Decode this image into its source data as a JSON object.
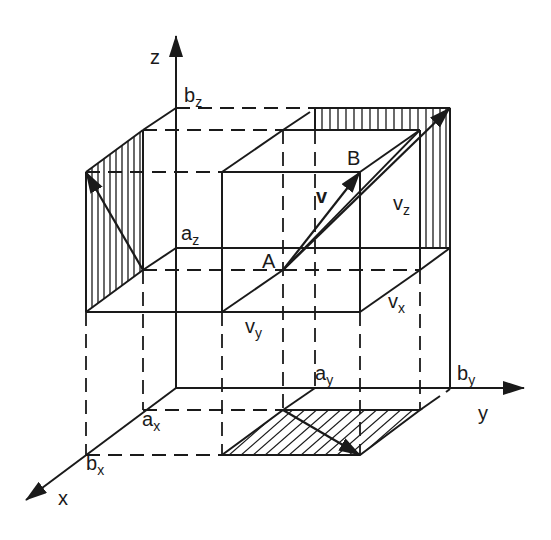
{
  "diagram": {
    "type": "3d-vector-components",
    "colors": {
      "ink": "#1a1a1a",
      "background": "#ffffff"
    },
    "axes": {
      "x": {
        "label": "x"
      },
      "y": {
        "label": "y"
      },
      "z": {
        "label": "z"
      }
    },
    "tick_labels": {
      "a_x": {
        "base": "a",
        "sub": "x"
      },
      "b_x": {
        "base": "b",
        "sub": "x"
      },
      "a_y": {
        "base": "a",
        "sub": "y"
      },
      "b_y": {
        "base": "b",
        "sub": "y"
      },
      "a_z": {
        "base": "a",
        "sub": "z"
      },
      "b_z": {
        "base": "b",
        "sub": "z"
      }
    },
    "points": {
      "A": "A",
      "B": "B"
    },
    "vector": {
      "label": "v"
    },
    "components": {
      "v_x": {
        "base": "v",
        "sub": "x"
      },
      "v_y": {
        "base": "v",
        "sub": "y"
      },
      "v_z": {
        "base": "v",
        "sub": "z"
      }
    },
    "projections": [
      "xz-plane (hatched vertical)",
      "yz-plane (hatched vertical)",
      "xy-plane (hatched diagonal)"
    ]
  }
}
